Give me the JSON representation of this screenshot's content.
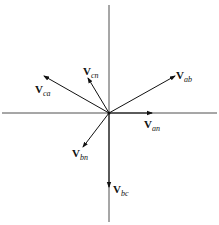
{
  "diagram": {
    "type": "phasor-diagram",
    "origin": [
      109,
      113
    ],
    "axes": {
      "horizontal": {
        "x1": 2,
        "x2": 217,
        "y": 113
      },
      "vertical": {
        "x": 109,
        "y1": 5,
        "y2": 222
      }
    },
    "stroke_color": "#111111",
    "phasors": [
      {
        "name": "Van",
        "main": "V",
        "sub": "an",
        "tip": [
          152,
          113
        ],
        "label_pos": [
          144,
          128
        ]
      },
      {
        "name": "Vab",
        "main": "V",
        "sub": "ab",
        "tip": [
          175,
          76
        ],
        "label_pos": [
          176,
          79
        ]
      },
      {
        "name": "Vbc",
        "main": "V",
        "sub": "bc",
        "tip": [
          109,
          187
        ],
        "label_pos": [
          113,
          193
        ]
      },
      {
        "name": "Vca",
        "main": "V",
        "sub": "ca",
        "tip": [
          44,
          76
        ],
        "label_pos": [
          35,
          93
        ]
      },
      {
        "name": "Vcn",
        "main": "V",
        "sub": "cn",
        "tip": [
          88,
          78
        ],
        "label_pos": [
          83,
          75
        ]
      },
      {
        "name": "Vbn",
        "main": "V",
        "sub": "bn",
        "tip": [
          83,
          147
        ],
        "label_pos": [
          72,
          157
        ]
      }
    ]
  }
}
